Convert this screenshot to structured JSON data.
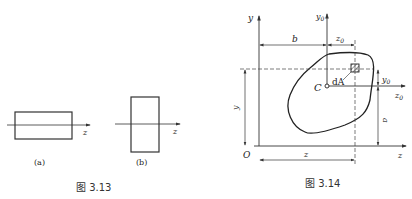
{
  "figure_313": {
    "caption": "图 3.13",
    "sub_a": {
      "label": "(a)",
      "axis": "z"
    },
    "sub_b": {
      "label": "(b)",
      "axis": "z"
    }
  },
  "figure_314": {
    "caption": "图 3.14",
    "labels": {
      "y": "y",
      "y0": "y",
      "y0_sub": "0",
      "b": "b",
      "z0_top": "z",
      "z0_top_sub": "0",
      "dA": "dA",
      "C": "C",
      "y0_dim": "y",
      "y0_dim_sub": "0",
      "z0_axis": "z",
      "z0_axis_sub": "0",
      "y_dim": "y",
      "a": "a",
      "O": "O",
      "z_dim": "z",
      "z_axis": "z"
    }
  }
}
